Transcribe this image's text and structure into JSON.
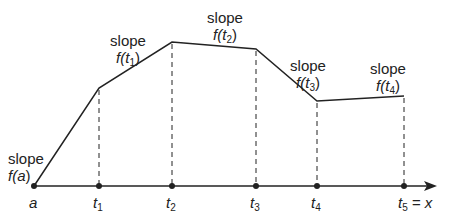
{
  "diagram": {
    "axis": {
      "label_end": "x",
      "arrow": true
    },
    "points": [
      {
        "name": "a",
        "label": "a",
        "sub": ""
      },
      {
        "name": "t1",
        "label": "t",
        "sub": "1"
      },
      {
        "name": "t2",
        "label": "t",
        "sub": "2"
      },
      {
        "name": "t3",
        "label": "t",
        "sub": "3"
      },
      {
        "name": "t4",
        "label": "t",
        "sub": "4"
      },
      {
        "name": "t5",
        "label": "t",
        "sub": "5",
        "suffix": " = x"
      }
    ],
    "slope_labels": [
      {
        "word": "slope",
        "func": "f(",
        "arg": "a",
        "sub": "",
        "close": ")"
      },
      {
        "word": "slope",
        "func": "f(",
        "arg": "t",
        "sub": "1",
        "close": ")"
      },
      {
        "word": "slope",
        "func": "f(",
        "arg": "t",
        "sub": "2",
        "close": ")"
      },
      {
        "word": "slope",
        "func": "f(",
        "arg": "t",
        "sub": "3",
        "close": ")"
      },
      {
        "word": "slope",
        "func": "f(",
        "arg": "t",
        "sub": "4",
        "close": ")"
      }
    ],
    "colors": {
      "line": "#222222",
      "background": "#ffffff"
    }
  }
}
